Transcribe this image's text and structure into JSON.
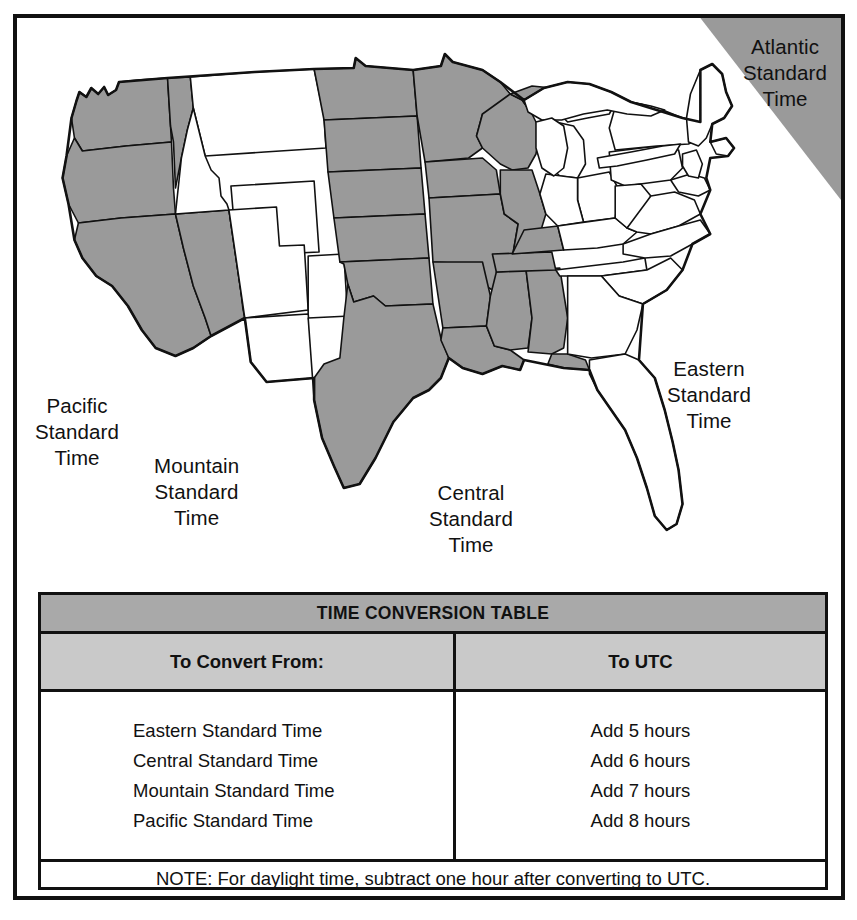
{
  "figure": {
    "kind": "us-time-zone-map-with-conversion-table"
  },
  "map": {
    "zone_labels": [
      {
        "id": "atlantic",
        "lines": [
          "Atlantic",
          "Standard",
          "Time"
        ],
        "shaded": true
      },
      {
        "id": "eastern",
        "lines": [
          "Eastern",
          "Standard",
          "Time"
        ],
        "shaded": false
      },
      {
        "id": "central",
        "lines": [
          "Central",
          "Standard",
          "Time"
        ],
        "shaded": true
      },
      {
        "id": "mountain",
        "lines": [
          "Mountain",
          "Standard",
          "Time"
        ],
        "shaded": false
      },
      {
        "id": "pacific",
        "lines": [
          "Pacific",
          "Standard",
          "Time"
        ],
        "shaded": true
      }
    ],
    "colors": {
      "shaded_zone_fill": "#9a9a9a",
      "unshaded_zone_fill": "#ffffff",
      "outline": "#111111"
    }
  },
  "table": {
    "title": "TIME CONVERSION TABLE",
    "headers": {
      "left": "To Convert From:",
      "right": "To UTC"
    },
    "rows": [
      {
        "from": "Eastern Standard Time",
        "to_utc": "Add 5 hours"
      },
      {
        "from": "Central Standard Time",
        "to_utc": "Add 6 hours"
      },
      {
        "from": "Mountain Standard Time",
        "to_utc": "Add 7 hours"
      },
      {
        "from": "Pacific Standard Time",
        "to_utc": "Add 8 hours"
      }
    ],
    "note": "NOTE: For daylight time, subtract one hour after converting to UTC.",
    "colors": {
      "title_bar": "#a9a9a9",
      "header_row": "#c9c9c9",
      "border": "#111111"
    }
  }
}
